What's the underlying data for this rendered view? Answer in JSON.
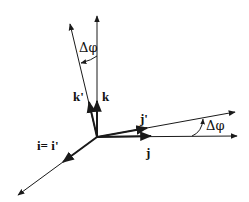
{
  "diagram": {
    "type": "coordinate-frame-rotation",
    "colors": {
      "line": "#1a1a1a",
      "background": "#ffffff"
    },
    "labels": {
      "k": "k",
      "k_prime": "k'",
      "j": "j",
      "j_prime": "j'",
      "i": "i= i'",
      "angle_top": "Δφ",
      "angle_right": "Δφ"
    },
    "axes": [
      {
        "name": "k",
        "from": [
          97,
          137
        ],
        "to": [
          97,
          14
        ]
      },
      {
        "name": "k_prime",
        "from": [
          97,
          137
        ],
        "to": [
          69,
          22
        ]
      },
      {
        "name": "j",
        "from": [
          97,
          137
        ],
        "to": [
          238,
          136
        ]
      },
      {
        "name": "j_prime",
        "from": [
          97,
          137
        ],
        "to": [
          236,
          112
        ]
      },
      {
        "name": "i",
        "from": [
          97,
          137
        ],
        "to": [
          17,
          196
        ]
      }
    ]
  }
}
